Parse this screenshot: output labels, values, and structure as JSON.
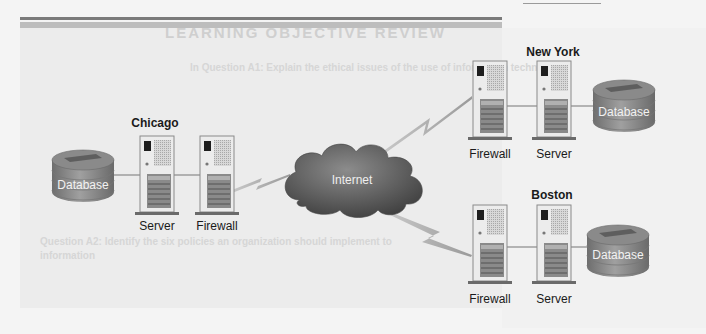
{
  "background": {
    "ghost_title": "LEARNING OBJECTIVE REVIEW",
    "ghost_lines": [
      "In Question A1: Explain the ethical issues of the use of information technology",
      "Question A2: Identify the six policies an organization should implement to",
      "information"
    ]
  },
  "network": {
    "cloud_label": "Internet",
    "sites": [
      {
        "name": "Chicago",
        "nodes": [
          {
            "type": "database",
            "label": "Database"
          },
          {
            "type": "server",
            "label": "Server"
          },
          {
            "type": "firewall",
            "label": "Firewall"
          }
        ]
      },
      {
        "name": "New York",
        "nodes": [
          {
            "type": "firewall",
            "label": "Firewall"
          },
          {
            "type": "server",
            "label": "Server"
          },
          {
            "type": "database",
            "label": "Database"
          }
        ]
      },
      {
        "name": "Boston",
        "nodes": [
          {
            "type": "firewall",
            "label": "Firewall"
          },
          {
            "type": "server",
            "label": "Server"
          },
          {
            "type": "database",
            "label": "Database"
          }
        ]
      }
    ]
  },
  "colors": {
    "line": "#8a8a8a",
    "cloud_dark": "#3f3f3f",
    "cloud_light": "#8c8c8c",
    "db_fill": "#8d8d8d",
    "server_fill": "#e6e6e6"
  }
}
